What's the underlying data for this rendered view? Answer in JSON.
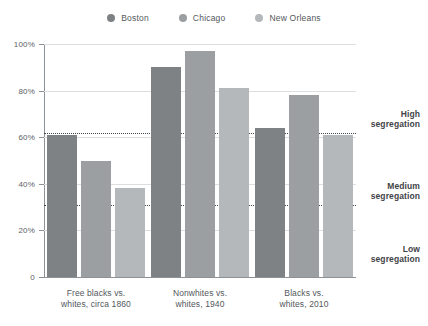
{
  "chart_data": {
    "type": "bar",
    "title": "",
    "xlabel": "",
    "ylabel": "",
    "ylim": [
      0,
      100
    ],
    "grid": true,
    "legend_position": "top-center",
    "categories": [
      "Free blacks vs. whites, circa 1860",
      "Nonwhites vs. whites, 1940",
      "Blacks vs. whites, 2010"
    ],
    "series": [
      {
        "name": "Boston",
        "color": "#7e8285",
        "values": [
          61,
          90,
          64
        ]
      },
      {
        "name": "Chicago",
        "color": "#9b9fa1",
        "values": [
          50,
          97,
          78
        ]
      },
      {
        "name": "New Orleans",
        "color": "#b5b8ba",
        "values": [
          38,
          81,
          61
        ]
      }
    ],
    "y_ticks": [
      {
        "value": 0,
        "label": "0"
      },
      {
        "value": 20,
        "label": "20%"
      },
      {
        "value": 40,
        "label": "40%"
      },
      {
        "value": 60,
        "label": "60%"
      },
      {
        "value": 80,
        "label": "80%"
      },
      {
        "value": 100,
        "label": "100%"
      }
    ],
    "thresholds": [
      {
        "value": 62,
        "label": "High segregation",
        "label_lines": [
          "High",
          "segregation"
        ]
      },
      {
        "value": 31,
        "label": "Medium segregation",
        "label_lines": [
          "Medium",
          "segregation"
        ]
      }
    ],
    "annotations": [
      {
        "label_lines": [
          "High",
          "segregation"
        ],
        "value_top": 72
      },
      {
        "label_lines": [
          "Medium",
          "segregation"
        ],
        "value_top": 41
      },
      {
        "label_lines": [
          "Low",
          "segregation"
        ],
        "value_top": 14
      }
    ]
  },
  "legend": {
    "items": [
      {
        "label": "Boston",
        "color": "#7e8285"
      },
      {
        "label": "Chicago",
        "color": "#9b9fa1"
      },
      {
        "label": "New Orleans",
        "color": "#b5b8ba"
      }
    ]
  },
  "category_labels": [
    {
      "line1": "Free blacks vs.",
      "line2": "whites, circa 1860"
    },
    {
      "line1": "Nonwhites vs.",
      "line2": "whites, 1940"
    },
    {
      "line1": "Blacks vs.",
      "line2": "whites, 2010"
    }
  ],
  "segmentation_labels": [
    {
      "line1": "High",
      "line2": "segregation"
    },
    {
      "line1": "Medium",
      "line2": "segregation"
    },
    {
      "line1": "Low",
      "line2": "segregation"
    }
  ]
}
